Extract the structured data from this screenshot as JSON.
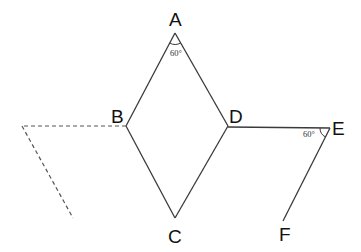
{
  "diagram": {
    "type": "geometry-figure",
    "points": {
      "A": {
        "label": "A"
      },
      "B": {
        "label": "B"
      },
      "C": {
        "label": "C"
      },
      "D": {
        "label": "D"
      },
      "E": {
        "label": "E"
      },
      "F": {
        "label": "F"
      }
    },
    "segments": [
      {
        "from": "A",
        "to": "B",
        "style": "solid"
      },
      {
        "from": "A",
        "to": "D",
        "style": "solid"
      },
      {
        "from": "B",
        "to": "C",
        "style": "solid"
      },
      {
        "from": "C",
        "to": "D",
        "style": "solid"
      },
      {
        "from": "D",
        "to": "E",
        "style": "solid"
      },
      {
        "from": "E",
        "to": "F",
        "style": "solid"
      }
    ],
    "dashed_lines": [
      {
        "description": "horizontal dashed line extending left from B"
      },
      {
        "description": "dashed line parallel to EF from left end of dashed horizontal"
      }
    ],
    "angles": [
      {
        "vertex": "A",
        "label": "60°"
      },
      {
        "vertex": "E",
        "label": "60°"
      }
    ]
  }
}
